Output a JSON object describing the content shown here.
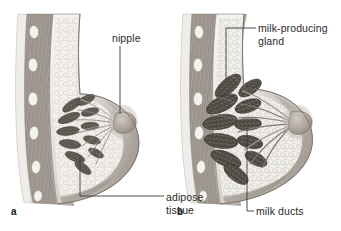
{
  "figure": {
    "background_color": "#ffffff",
    "width": 341,
    "height": 231
  },
  "panels": [
    {
      "letter": "a",
      "name": "non-lactating-breast",
      "description": "Sagittal section of a non-lactating breast showing small mammary lobules, ducts converging on the nipple, and surrounding adipose tissue against the chest wall.",
      "labels": [
        {
          "id": "nipple",
          "text": "nipple",
          "leader": "vertical-down"
        },
        {
          "id": "adipose-tissue",
          "text": "adipose\ntissue",
          "line1": "adipose",
          "line2": "tissue",
          "leader": "elbow-left-up"
        }
      ]
    },
    {
      "letter": "b",
      "name": "lactating-breast",
      "description": "Sagittal section of a lactating breast showing enlarged milk-producing glands (alveoli) and widened milk ducts converging on the nipple.",
      "labels": [
        {
          "id": "milk-producing-gland",
          "text": "milk-producing\ngland",
          "line1": "milk-producing",
          "line2": "gland",
          "leader": "elbow-left-down"
        },
        {
          "id": "milk-ducts",
          "text": "milk ducts",
          "leader": "elbow-left-up"
        }
      ]
    }
  ],
  "colors": {
    "label_text": "#2b2b2b",
    "leader_line": "#3a3a3a",
    "skin_light": "#e9e6e2",
    "skin_mid": "#cfcac4",
    "skin_shadow": "#a9a29b",
    "adipose_fill": "#efeeea",
    "adipose_cell": "#d6d3cc",
    "muscle_fill": "#b9b2aa",
    "muscle_stripe": "#8d867e",
    "rib_fill": "#f3f1ed",
    "gland_dark": "#6e6860",
    "gland_stipple": "#443f39",
    "gland_light": "#9b948c",
    "duct_line": "#8b847c",
    "outline": "#5e584f"
  }
}
